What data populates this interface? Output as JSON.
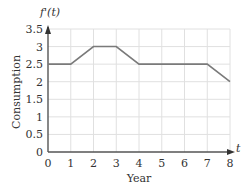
{
  "chart_data": {
    "type": "line",
    "title": "",
    "xlabel": "Year",
    "ylabel": "Consumption",
    "x_axis_var": "t",
    "y_axis_func": "f'(t)",
    "x": [
      0,
      1,
      2,
      3,
      4,
      5,
      6,
      7,
      8
    ],
    "series": [
      {
        "name": "f'(t)",
        "values": [
          2.5,
          2.5,
          3,
          3,
          2.5,
          2.5,
          2.5,
          2.5,
          2
        ]
      }
    ],
    "xlim": [
      0,
      8
    ],
    "ylim": [
      0,
      3.5
    ],
    "x_ticks": [
      "0",
      "1",
      "2",
      "3",
      "4",
      "5",
      "6",
      "7",
      "8"
    ],
    "y_ticks": [
      "0",
      "0.5",
      "1",
      "1.5",
      "2",
      "2.5",
      "3",
      "3.5"
    ],
    "grid": true,
    "legend": null
  },
  "colors": {
    "line": "#7a7a7a",
    "axis": "#555555",
    "grid": "#e0e0e0",
    "text": "#333333"
  }
}
